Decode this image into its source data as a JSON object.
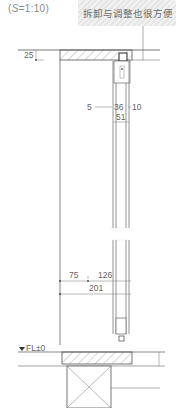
{
  "scale_label": {
    "prefix": "(",
    "s": "S",
    "rest": "=1:10)"
  },
  "callout": {
    "text": "拆卸与调整也很方便"
  },
  "dimensions": {
    "top_gap": "25",
    "left_offset": "5",
    "panel_width": "36",
    "right_offset": "10",
    "total_track": "51",
    "wall_to_panel": "75",
    "panel_span": "126",
    "overall": "201"
  },
  "level_mark": {
    "label": "FL±0"
  },
  "colors": {
    "line": "#555555",
    "hatch": "#9a9a9a",
    "light": "#bdbdbd"
  }
}
